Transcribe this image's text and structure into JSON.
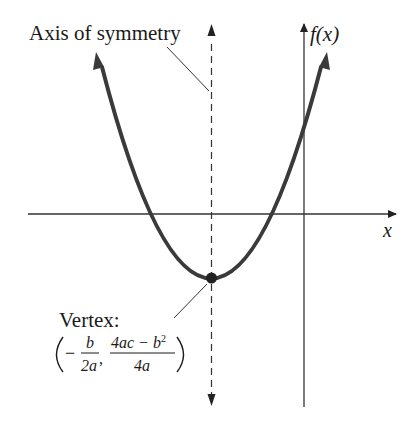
{
  "diagram": {
    "type": "parabola-graph",
    "labels": {
      "axis_of_symmetry": "Axis of symmetry",
      "y_axis": "f(x)",
      "x_axis": "x",
      "vertex_title": "Vertex:",
      "vertex_x_num": "b",
      "vertex_x_den": "2a",
      "vertex_y_num": "4ac − b",
      "vertex_y_num_exp": "2",
      "vertex_y_den": "4a",
      "minus": "−",
      "comma": ","
    },
    "colors": {
      "curve": "#3a3a3a",
      "axes": "#333333",
      "text": "#1a1a1a"
    }
  }
}
